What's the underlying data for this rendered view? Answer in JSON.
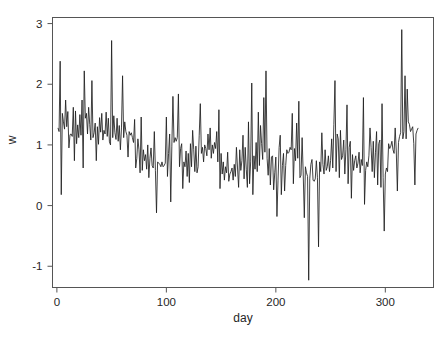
{
  "figure": {
    "background_color": "#ffffff",
    "line_color": "#1f1f1f",
    "axis_color": "#555555",
    "caption": ""
  },
  "chart_data": {
    "type": "line",
    "title": "",
    "subtitle": "",
    "xlabel": "day",
    "ylabel": "w",
    "ylabel_rotated": true,
    "xlim": [
      -4,
      344
    ],
    "ylim": [
      -1.35,
      3.1
    ],
    "xticks": [
      0,
      100,
      200,
      300
    ],
    "xtick_labels": [
      "0",
      "100",
      "200",
      "300"
    ],
    "yticks": [
      -1,
      0,
      1,
      2,
      3
    ],
    "ytick_labels": [
      "-1",
      "0",
      "1",
      "2",
      "3"
    ],
    "grid": false,
    "legend": false,
    "legend_position": "none",
    "series": [
      {
        "name": "w",
        "x_start": 1,
        "x_step": 1,
        "n_points": 340,
        "y_min": -1.23,
        "y_max": 2.9,
        "y_mean": 0.95,
        "values": [
          1.28,
          1.22,
          2.38,
          0.18,
          1.52,
          1.38,
          1.26,
          1.74,
          1.3,
          1.55,
          0.95,
          1.17,
          1.18,
          1.14,
          1.62,
          0.74,
          1.56,
          1.02,
          1.33,
          1.12,
          1.5,
          1.16,
          1.74,
          0.62,
          2.22,
          1.44,
          1.52,
          1.18,
          1.62,
          1.34,
          1.08,
          2.06,
          1.12,
          1.2,
          1.36,
          0.74,
          1.3,
          1.01,
          1.45,
          1.21,
          1.52,
          1.08,
          1.24,
          1.18,
          1.54,
          1.14,
          1.44,
          1.05,
          1.0,
          2.72,
          1.12,
          1.48,
          1.2,
          1.09,
          1.44,
          1.06,
          1.32,
          0.92,
          1.28,
          2.14,
          1.12,
          1.38,
          1.22,
          1.16,
          0.8,
          1.22,
          1.16,
          1.2,
          1.12,
          1.04,
          1.42,
          0.62,
          0.78,
          1.1,
          0.92,
          0.54,
          1.46,
          0.58,
          0.92,
          0.74,
          0.84,
          0.6,
          1.0,
          0.46,
          0.78,
          0.95,
          0.66,
          0.62,
          1.22,
          0.58,
          -0.12,
          0.72,
          0.7,
          0.68,
          0.64,
          0.72,
          0.64,
          0.66,
          0.7,
          1.46,
          0.48,
          0.86,
          1.18,
          0.06,
          0.98,
          1.8,
          1.04,
          1.12,
          1.06,
          1.12,
          1.84,
          0.64,
          0.94,
          1.02,
          0.28,
          0.72,
          0.64,
          0.9,
          0.48,
          0.86,
          0.38,
          1.02,
          0.64,
          1.24,
          0.92,
          0.56,
          0.98,
          0.54,
          0.64,
          1.16,
          1.68,
          0.86,
          0.96,
          0.72,
          1.0,
          0.94,
          0.82,
          1.18,
          0.92,
          1.28,
          0.78,
          1.0,
          0.86,
          1.04,
          0.94,
          1.22,
          0.72,
          1.58,
          0.28,
          0.86,
          0.52,
          0.72,
          0.42,
          0.64,
          0.54,
          0.88,
          0.4,
          0.52,
          0.56,
          0.62,
          0.42,
          0.68,
          0.48,
          0.96,
          0.62,
          0.3,
          0.92,
          0.58,
          0.74,
          1.16,
          0.44,
          0.96,
          0.6,
          0.3,
          1.38,
          0.36,
          0.72,
          2.02,
          0.18,
          0.82,
          0.6,
          1.04,
          0.56,
          1.54,
          0.66,
          1.32,
          1.02,
          0.76,
          1.78,
          0.88,
          2.22,
          0.78,
          0.5,
          0.94,
          0.34,
          0.8,
          0.82,
          0.26,
          0.54,
          0.8,
          -0.18,
          0.42,
          0.96,
          1.16,
          0.18,
          0.66,
          0.86,
          0.24,
          0.66,
          0.92,
          0.86,
          0.88,
          0.96,
          0.92,
          1.52,
          0.36,
          0.94,
          0.74,
          1.36,
          0.78,
          1.72,
          0.46,
          0.5,
          1.12,
          0.52,
          -0.2,
          0.64,
          0.54,
          0.48,
          -1.23,
          0.44,
          0.68,
          0.76,
          0.42,
          0.4,
          0.44,
          0.74,
          0.46,
          -0.68,
          0.72,
          0.56,
          1.2,
          0.68,
          0.52,
          0.92,
          0.58,
          0.64,
          0.82,
          0.56,
          0.74,
          1.1,
          0.62,
          1.34,
          2.06,
          0.56,
          1.18,
          1.1,
          0.46,
          1.24,
          0.76,
          0.82,
          1.08,
          0.52,
          0.92,
          1.66,
          0.36,
          0.96,
          1.06,
          0.12,
          0.84,
          0.58,
          0.74,
          0.82,
          0.62,
          0.7,
          0.88,
          0.54,
          0.76,
          0.66,
          1.78,
          0.02,
          0.58,
          0.72,
          0.64,
          0.82,
          1.28,
          0.96,
          0.56,
          1.06,
          0.46,
          0.88,
          1.22,
          0.34,
          1.02,
          1.08,
          0.3,
          1.68,
          0.46,
          -0.42,
          0.52,
          0.62,
          0.56,
          1.02,
          0.94,
          0.98,
          1.06,
          0.92,
          0.86,
          1.28,
          0.9,
          0.24,
          1.04,
          1.14,
          1.2,
          2.9,
          1.1,
          1.22,
          2.14,
          1.1,
          1.92,
          1.38,
          1.34,
          1.22,
          1.26,
          1.3,
          1.02,
          0.34,
          1.18,
          1.24,
          1.28
        ]
      }
    ]
  }
}
